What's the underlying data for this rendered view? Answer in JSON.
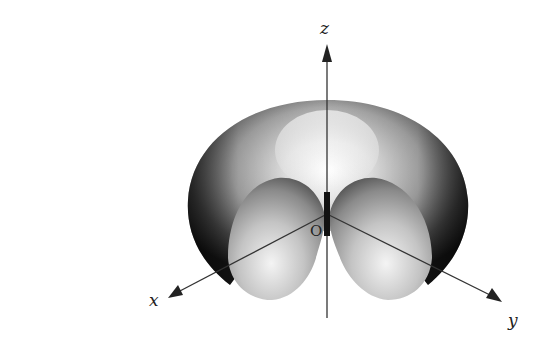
{
  "figure": {
    "axes": {
      "x": {
        "label": "x"
      },
      "y": {
        "label": "y"
      },
      "z": {
        "label": "z"
      }
    },
    "origin": {
      "label": "O"
    }
  },
  "colors": {
    "background": "#ffffff",
    "axis": "#333333",
    "surface_dark": "#1a1a1a",
    "surface_mid": "#8a8a8a",
    "surface_light": "#f2f2f2",
    "rod": "#111111"
  }
}
